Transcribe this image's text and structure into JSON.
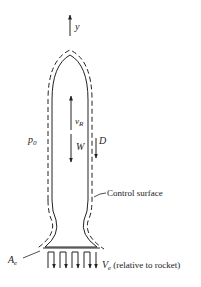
{
  "diagram": {
    "type": "rocket control volume",
    "colors": {
      "ink": "#222222",
      "background": "#ffffff"
    },
    "labels": {
      "axis": "y",
      "velocity_main": "v",
      "velocity_sub": "R",
      "weight": "W",
      "drag": "D",
      "ambient_pressure_main": "p",
      "ambient_pressure_sub": "0",
      "control_surface": "Control surface",
      "exit_area_main": "A",
      "exit_area_sub": "e",
      "exit_velocity_main": "V",
      "exit_velocity_sub": "e",
      "exit_velocity_note": "(relative to rocket)"
    }
  }
}
